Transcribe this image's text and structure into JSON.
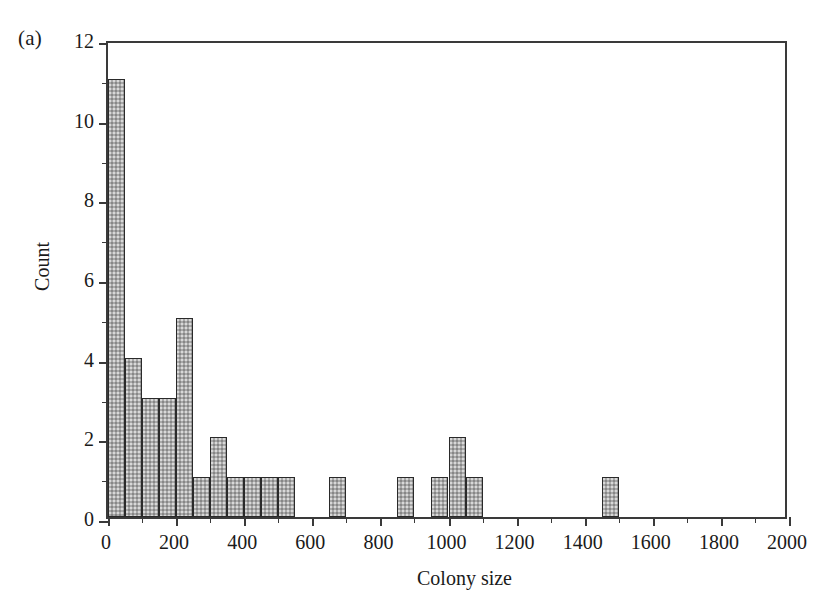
{
  "panel": {
    "label": "(a)"
  },
  "chart_data": {
    "type": "bar",
    "title": "",
    "subtitle": "",
    "xlabel": "Colony size",
    "ylabel": "Count",
    "xlim": [
      0,
      2000
    ],
    "ylim": [
      0,
      12
    ],
    "bin_width": 50,
    "grid": false,
    "legend": null,
    "x_tick_labels": [
      "0",
      "200",
      "400",
      "600",
      "800",
      "1000",
      "1200",
      "1400",
      "1600",
      "1800",
      "2000"
    ],
    "x_ticks": [
      0,
      200,
      400,
      600,
      800,
      1000,
      1200,
      1400,
      1600,
      1800,
      2000
    ],
    "x_minor_ticks": [
      100,
      300,
      500,
      700,
      900,
      1100,
      1300,
      1500,
      1700,
      1900
    ],
    "y_tick_labels": [
      "0",
      "2",
      "4",
      "6",
      "8",
      "10",
      "12"
    ],
    "y_ticks": [
      0,
      2,
      4,
      6,
      8,
      10,
      12
    ],
    "y_minor_ticks": [
      1,
      3,
      5,
      7,
      9,
      11
    ],
    "bar_fill_color": "#a9a9a9",
    "bar_edge_color": "#2a2a2a",
    "axis_color": "#3a3a3a",
    "background_color": "#ffffff",
    "bins": [
      {
        "x0": 0,
        "x1": 50,
        "count": 11
      },
      {
        "x0": 50,
        "x1": 100,
        "count": 4
      },
      {
        "x0": 100,
        "x1": 150,
        "count": 3
      },
      {
        "x0": 150,
        "x1": 200,
        "count": 3
      },
      {
        "x0": 200,
        "x1": 250,
        "count": 5
      },
      {
        "x0": 250,
        "x1": 300,
        "count": 1
      },
      {
        "x0": 300,
        "x1": 350,
        "count": 2
      },
      {
        "x0": 350,
        "x1": 400,
        "count": 1
      },
      {
        "x0": 400,
        "x1": 450,
        "count": 1
      },
      {
        "x0": 450,
        "x1": 500,
        "count": 1
      },
      {
        "x0": 500,
        "x1": 550,
        "count": 1
      },
      {
        "x0": 650,
        "x1": 700,
        "count": 1
      },
      {
        "x0": 850,
        "x1": 900,
        "count": 1
      },
      {
        "x0": 950,
        "x1": 1000,
        "count": 1
      },
      {
        "x0": 1000,
        "x1": 1050,
        "count": 2
      },
      {
        "x0": 1050,
        "x1": 1100,
        "count": 1
      },
      {
        "x0": 1450,
        "x1": 1500,
        "count": 1
      }
    ]
  }
}
